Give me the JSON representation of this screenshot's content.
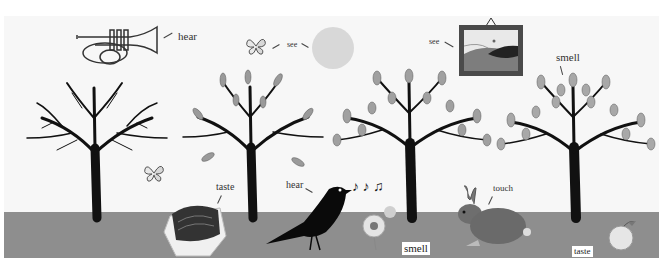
{
  "scene": {
    "title": "Five senses illustration",
    "colors": {
      "sky": "#f7f7f7",
      "ground": "#8e8e8e",
      "tree": "#111111",
      "leaf": "#9a9a9a",
      "sun": "#d8d8d8"
    },
    "labels": {
      "trumpet_hear": "hear",
      "butterfly_see": "see",
      "painting_see": "see",
      "tree_smell": "smell",
      "chocolate_taste": "taste",
      "bird_hear": "hear",
      "rabbit_touch": "touch",
      "flower_smell": "smell",
      "apple_taste": "taste"
    },
    "objects": [
      "trumpet",
      "butterfly",
      "sun",
      "framed-painting",
      "bare-tree",
      "leafy-tree",
      "leafy-tree",
      "leafy-tree",
      "butterfly",
      "chocolate",
      "blackbird",
      "music-notes",
      "flower",
      "rabbit",
      "apple"
    ]
  }
}
